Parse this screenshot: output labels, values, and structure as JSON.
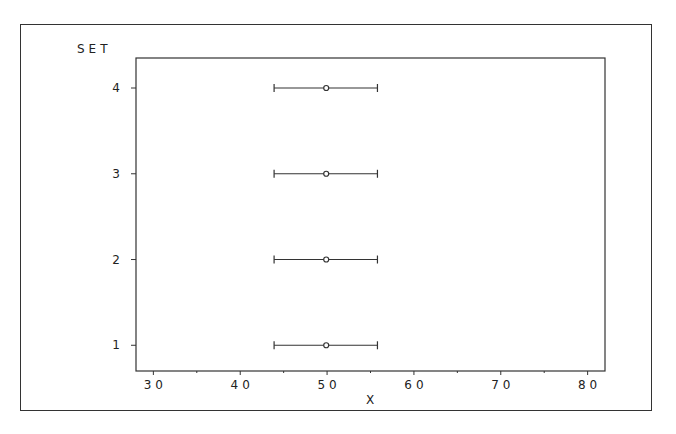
{
  "chart_data": {
    "type": "scatter",
    "subtype": "horizontal-error-bar",
    "title": "",
    "xlabel": "X",
    "ylabel": "SET",
    "xlim": [
      28,
      82
    ],
    "xticks": [
      30,
      40,
      50,
      60,
      70,
      80
    ],
    "xtick_labels": [
      "30",
      "40",
      "50",
      "60",
      "70",
      "80"
    ],
    "ylim": [
      0.7,
      4.35
    ],
    "yticks": [
      1,
      2,
      3,
      4
    ],
    "ytick_labels": [
      "1",
      "2",
      "3",
      "4"
    ],
    "grid": false,
    "legend": null,
    "series": [
      {
        "name": "SET 1",
        "y": 1,
        "center": 49.9,
        "low": 43.9,
        "high": 55.8
      },
      {
        "name": "SET 2",
        "y": 2,
        "center": 49.9,
        "low": 43.9,
        "high": 55.8
      },
      {
        "name": "SET 3",
        "y": 3,
        "center": 49.9,
        "low": 43.9,
        "high": 55.8
      },
      {
        "name": "SET 4",
        "y": 4,
        "center": 49.9,
        "low": 43.9,
        "high": 55.8
      }
    ]
  }
}
